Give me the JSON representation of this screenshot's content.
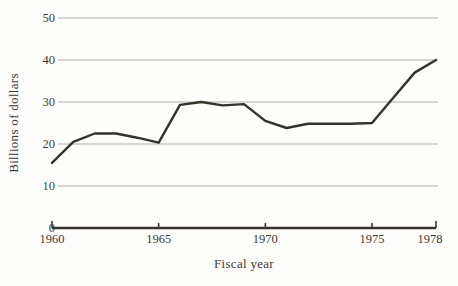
{
  "figure": {
    "ylabel": "Billions of dollars",
    "xlabel": "Fiscal year"
  },
  "chart_data": {
    "type": "line",
    "title": "",
    "xlabel": "Fiscal year",
    "ylabel": "Billions of dollars",
    "x": [
      1960,
      1961,
      1962,
      1963,
      1964,
      1965,
      1966,
      1967,
      1968,
      1969,
      1970,
      1971,
      1972,
      1973,
      1974,
      1975,
      1976,
      1977,
      1978
    ],
    "values": [
      15.5,
      20.5,
      22.5,
      22.5,
      21.5,
      20.3,
      29.3,
      30,
      29.2,
      29.5,
      25.5,
      23.8,
      24.8,
      24.8,
      24.8,
      25,
      31,
      37,
      40
    ],
    "xticks": [
      1960,
      1965,
      1970,
      1975,
      1978
    ],
    "yticks": [
      0,
      10,
      20,
      30,
      40,
      50
    ],
    "xlim": [
      1960,
      1978
    ],
    "ylim": [
      0,
      50
    ],
    "grid": "horizontal-gridlines-at-each-ytick",
    "legend": "none",
    "line_color": "#35312b",
    "grid_color": "#aaa39a",
    "axis_color": "#38342d",
    "text_color": "#3e3a33",
    "background_color": "#fdfdfb"
  }
}
